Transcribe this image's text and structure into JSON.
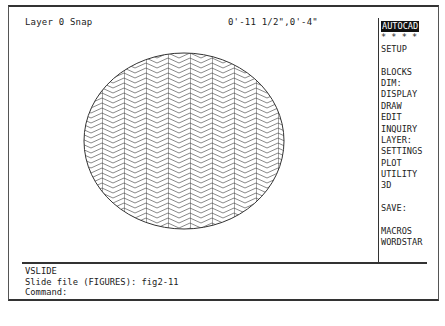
{
  "status_bar": {
    "layer_snap": "Layer 0 Snap",
    "coordinates": "0'-11 1/2\",0'-4\""
  },
  "screen_menu": {
    "items": [
      {
        "label": "AUTOCAD",
        "active": true
      },
      {
        "label": "* * * *"
      },
      {
        "label": "SETUP"
      },
      {
        "label": ""
      },
      {
        "label": "BLOCKS"
      },
      {
        "label": "DIM:"
      },
      {
        "label": "DISPLAY"
      },
      {
        "label": "DRAW"
      },
      {
        "label": "EDIT"
      },
      {
        "label": "INQUIRY"
      },
      {
        "label": "LAYER:"
      },
      {
        "label": "SETTINGS"
      },
      {
        "label": "PLOT"
      },
      {
        "label": "UTILITY"
      },
      {
        "label": "3D"
      },
      {
        "label": ""
      },
      {
        "label": "SAVE:"
      },
      {
        "label": ""
      },
      {
        "label": "MACROS"
      },
      {
        "label": "WORDSTAR"
      }
    ]
  },
  "drawing": {
    "shape": "ellipse",
    "hatch": "herringbone",
    "line_color": "#444444"
  },
  "command_area": {
    "lines": [
      "VSLIDE",
      "Slide file (FIGURES): fig2-11",
      "Command:"
    ]
  }
}
